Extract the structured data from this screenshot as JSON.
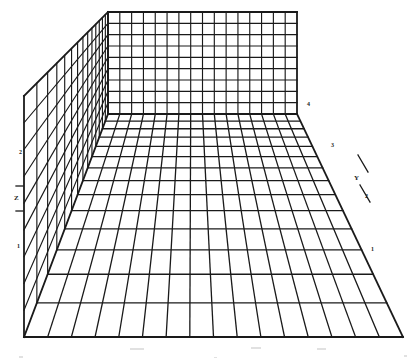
{
  "figure": {
    "background_color": "#ffffff",
    "line_color": "#1a1a1a",
    "style": "scanned monochrome technical line drawing"
  },
  "axes": {
    "vertical": {
      "name": "Z",
      "position": "left",
      "ticks": [
        {
          "label": "1",
          "x": 17,
          "y": 243
        },
        {
          "label": "2",
          "x": 19,
          "y": 149
        }
      ],
      "name_label": {
        "text": "Z",
        "x": 14,
        "y": 198
      },
      "tick_marks": [
        {
          "x": 16,
          "y": 186,
          "w": 7,
          "h": 1
        },
        {
          "x": 16,
          "y": 211,
          "w": 7,
          "h": 1
        }
      ]
    },
    "depth": {
      "name": "Y",
      "position": "right",
      "ticks": [
        {
          "label": "1",
          "x": 371,
          "y": 246
        },
        {
          "label": "2",
          "x": 365,
          "y": 193
        },
        {
          "label": "3",
          "x": 331,
          "y": 142
        },
        {
          "label": "4",
          "x": 307,
          "y": 101
        }
      ],
      "name_label": {
        "text": "Y",
        "x": 354,
        "y": 178
      },
      "tick_marks": [
        {
          "x1": 358,
          "y1": 155,
          "x2": 368,
          "y2": 172
        },
        {
          "x1": 360,
          "y1": 185,
          "x2": 370,
          "y2": 202
        }
      ]
    },
    "horizontal": {
      "name": "X",
      "position": "bottom",
      "ticks": []
    }
  },
  "geometry": {
    "floor": {
      "columns": 16,
      "rows": 14,
      "front_left": {
        "x": 24,
        "y": 337
      },
      "front_right": {
        "x": 403,
        "y": 337
      },
      "back_left": {
        "x": 108,
        "y": 114
      },
      "back_right": {
        "x": 297,
        "y": 114
      }
    },
    "back_wall": {
      "columns": 16,
      "rows": 9,
      "top_left": {
        "x": 108,
        "y": 12
      },
      "top_right": {
        "x": 297,
        "y": 12
      },
      "bottom_left": {
        "x": 108,
        "y": 114
      },
      "bottom_right": {
        "x": 297,
        "y": 114
      }
    },
    "left_wall": {
      "columns": 14,
      "rows": 9,
      "front_top": {
        "x": 24,
        "y": 96
      },
      "front_bottom": {
        "x": 24,
        "y": 337
      },
      "back_top": {
        "x": 108,
        "y": 12
      },
      "back_bottom": {
        "x": 108,
        "y": 114
      }
    }
  },
  "artifacts": [
    {
      "x": 19,
      "y": 356,
      "w": 4,
      "h": 2
    },
    {
      "x": 214,
      "y": 357,
      "w": 3,
      "h": 1
    },
    {
      "x": 404,
      "y": 355,
      "w": 3,
      "h": 2
    },
    {
      "x": 130,
      "y": 348,
      "w": 14,
      "h": 2
    },
    {
      "x": 251,
      "y": 347,
      "w": 10,
      "h": 2
    },
    {
      "x": 317,
      "y": 348,
      "w": 9,
      "h": 2
    }
  ]
}
